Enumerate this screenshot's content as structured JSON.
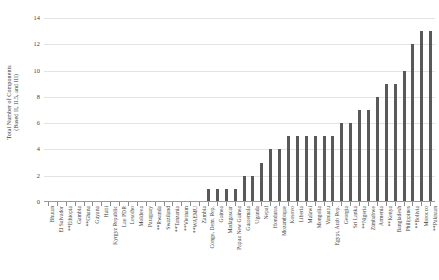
{
  "chart_data": {
    "type": "bar",
    "title": "",
    "xlabel": "",
    "ylabel": "Total Number of Components (Based II, II.5, and III)",
    "ylabel_lines": [
      "Total Number of Components",
      "(Based II, II.5, and III)"
    ],
    "ylim": [
      0,
      14
    ],
    "ytick_values": [
      0,
      2,
      4,
      6,
      8,
      10,
      12,
      14
    ],
    "ytick_labels": [
      "0",
      "2",
      "4",
      "6",
      "8",
      "10",
      "12",
      "14"
    ],
    "grid": true,
    "legend": "none",
    "bar_color": "#595959",
    "gridline_color": "#e3e3e3",
    "axis_color": "#9a9a9a",
    "categories": [
      "Bhutan",
      "El Salvador",
      "**Ethiopia",
      "Gambia",
      "**Ghana",
      "Guyana",
      "Haiti",
      "Kyrgyz Republic",
      "Lao PDR",
      "Lesotho",
      "Moldova",
      "Paraguay",
      "**Rwanda",
      "Swaziland",
      "**Tanzania",
      "**Vietnam",
      "**WAEMU",
      "Zambia",
      "Congo, Dem. Rep.",
      "Guinea",
      "Madagascar",
      "Papua New Guinea",
      "Guatemala",
      "Uganda",
      "Nepal",
      "Honduras",
      "Mozambique",
      "Kosovo",
      "Liberia",
      "Malawi",
      "Mongolia",
      "Vanuatu",
      "Egypt, Arab Rep.",
      "Georgia",
      "Sri Lanka",
      "**Nigeria",
      "Zimbabwe",
      "Armenia",
      "**Kenya",
      "Bangladesh",
      "Philippines",
      "**Bolivia",
      "Morocco",
      "**Pakistan"
    ],
    "values": [
      0,
      0,
      0,
      0,
      0,
      0,
      0,
      0,
      0,
      0,
      0,
      0,
      0,
      0,
      0,
      0,
      0,
      0,
      1,
      1,
      1,
      1,
      2,
      2,
      3,
      4,
      4,
      5,
      5,
      5,
      5,
      5,
      5,
      6,
      6,
      7,
      7,
      8,
      9,
      9,
      10,
      12,
      13,
      13
    ]
  }
}
